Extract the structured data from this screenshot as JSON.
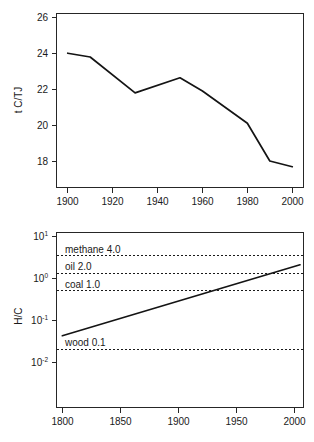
{
  "figure": {
    "name": "decarbonization-two-panel-figure",
    "panel_count": 2
  },
  "chart_data": [
    {
      "id": "top",
      "type": "line",
      "title": "",
      "xlabel": "",
      "ylabel": "t C/TJ",
      "xlim": [
        1895,
        2005
      ],
      "ylim": [
        17.2,
        26.4
      ],
      "xticks": [
        1900,
        1920,
        1940,
        1960,
        1980,
        2000
      ],
      "xticklabels": [
        "1900",
        "1920",
        "1940",
        "1960",
        "1980",
        "2000"
      ],
      "yticks": [
        18,
        20,
        22,
        24,
        26
      ],
      "yticklabels": [
        "18",
        "20",
        "22",
        "24",
        "26"
      ],
      "grid": false,
      "legend": "none",
      "x": [
        1900,
        1910,
        1930,
        1950,
        1960,
        1980,
        1990,
        2000
      ],
      "values": [
        24.3,
        24.1,
        22.2,
        23.0,
        22.3,
        20.6,
        18.6,
        18.3
      ],
      "series": [
        {
          "name": "carbon intensity",
          "x": [
            1900,
            1910,
            1930,
            1950,
            1960,
            1980,
            1990,
            2000
          ],
          "values": [
            24.3,
            24.1,
            22.2,
            23.0,
            22.3,
            20.6,
            18.6,
            18.3
          ]
        }
      ]
    },
    {
      "id": "bottom",
      "type": "line",
      "title": "",
      "xlabel": "",
      "ylabel": "H/C",
      "yscale": "log",
      "xlim": [
        1795,
        2008
      ],
      "ylim": [
        0.01,
        10
      ],
      "xticks": [
        1800,
        1850,
        1900,
        1950,
        2000
      ],
      "xticklabels": [
        "1800",
        "1850",
        "1900",
        "1950",
        "2000"
      ],
      "yticks": [
        10,
        1,
        0.1,
        0.01
      ],
      "yticklabels": [
        "10¹",
        "10⁰",
        "10⁻¹",
        "10⁻²"
      ],
      "ytickmantissa": [
        "10",
        "10",
        "10",
        "10"
      ],
      "ytickexponent": [
        "1",
        "0",
        "-1",
        "-2"
      ],
      "grid": false,
      "legend": "none",
      "x": [
        1800,
        2005
      ],
      "values": [
        0.17,
        2.8
      ],
      "series": [
        {
          "name": "hydrogen to carbon ratio",
          "x": [
            1800,
            2005
          ],
          "values": [
            0.17,
            2.8
          ]
        }
      ],
      "reference_lines": [
        {
          "label": "methane 4.0",
          "fuel": "methane",
          "value": 4.0,
          "style": "dashed"
        },
        {
          "label": "oil 2.0",
          "fuel": "oil",
          "value": 2.0,
          "style": "dashed"
        },
        {
          "label": "coal 1.0",
          "fuel": "coal",
          "value": 1.0,
          "style": "dashed"
        },
        {
          "label": "wood 0.1",
          "fuel": "wood",
          "value": 0.1,
          "style": "dashed"
        }
      ]
    }
  ],
  "top_panel": {
    "name": "carbon-intensity-chart",
    "ylabel": "t C/TJ",
    "xticklabels": [
      "1900",
      "1920",
      "1940",
      "1960",
      "1980",
      "2000"
    ],
    "yticklabels": [
      "18",
      "20",
      "22",
      "24",
      "26"
    ]
  },
  "bottom_panel": {
    "name": "hydrogen-carbon-ratio-chart",
    "ylabel": "H/C",
    "xticklabels": [
      "1800",
      "1850",
      "1900",
      "1950",
      "2000"
    ],
    "yticklabels": [
      "10",
      "10",
      "10",
      "10"
    ],
    "yexponents": [
      "1",
      "0",
      "-1",
      "-2"
    ],
    "reference_labels": [
      "methane 4.0",
      "oil 2.0",
      "coal 1.0",
      "wood 0.1"
    ]
  },
  "colors": {
    "line": "#141414",
    "axis": "#262626",
    "text": "#1a1a1a",
    "background": "#ffffff"
  }
}
